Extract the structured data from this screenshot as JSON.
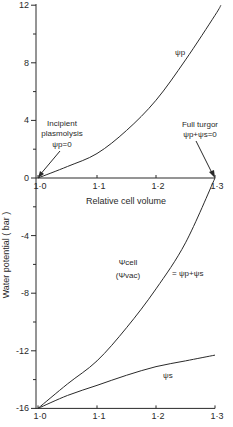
{
  "chart_data": {
    "type": "line",
    "title": "",
    "ylabel": "Water potential ( bar )",
    "xlabel": "Relative cell volume",
    "ylim": [
      -16,
      12
    ],
    "xlim": [
      1.0,
      1.3
    ],
    "yticks": [
      12,
      8,
      4,
      0,
      -4,
      -8,
      -12,
      -16
    ],
    "yticks_minor": [
      10,
      6,
      2,
      -2,
      -6,
      -10,
      -14
    ],
    "xticks": [
      1.0,
      1.1,
      1.2,
      1.3
    ],
    "xtick_labels_middle": [
      "1·0",
      "1·1",
      "1·2",
      "1·3"
    ],
    "xtick_labels_bottom": [
      "1·0",
      "1·1",
      "1·2",
      "1·3"
    ],
    "ytick_labels": [
      "12",
      "8",
      "4",
      "0",
      "-4",
      "-8",
      "-12",
      "-16"
    ],
    "grid": false,
    "legend": "none (curves labeled inline)",
    "x": [
      1.0,
      1.05,
      1.1,
      1.15,
      1.2,
      1.25,
      1.3,
      1.31
    ],
    "series": [
      {
        "name": "ψp",
        "values": [
          0,
          0.8,
          1.7,
          3.3,
          5.4,
          8.2,
          11.3,
          12
        ]
      },
      {
        "name": "ψs",
        "values": [
          -16,
          -15.1,
          -14.4,
          -13.7,
          -13.1,
          -12.7,
          -12.3,
          null
        ]
      },
      {
        "name": "Ψcell (Ψvac) = ψp + ψs",
        "values": [
          -16,
          -14.3,
          -12.7,
          -10.4,
          -7.7,
          -4.5,
          0,
          null
        ]
      }
    ],
    "annotations": [
      {
        "text": "Incipient plasmolysis ψp = 0",
        "x": 1.0,
        "y": 0
      },
      {
        "text": "Full turgor ψp + ψs = 0",
        "x": 1.3,
        "y": 0
      }
    ]
  },
  "labels": {
    "ylabel": "Water potential ( bar )",
    "xlabel": "Relative cell volume",
    "incipient_line1": "Incipient",
    "incipient_line2": "plasmolysis",
    "incipient_line3": "ψp=0",
    "fullturgor_line1": "Full turgor",
    "fullturgor_line2": "ψp+ψs=0",
    "psi_p": "ψp",
    "psi_s": "ψs",
    "psi_cell": "Ψcell",
    "psi_vac": "(Ψvac)",
    "psi_sum": "= ψp+ψs"
  }
}
